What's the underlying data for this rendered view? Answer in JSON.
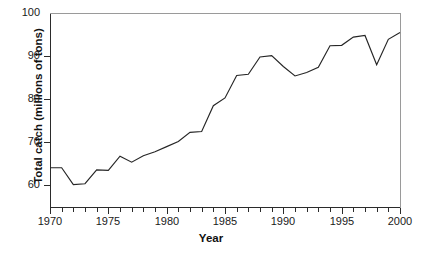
{
  "chart_data": {
    "type": "line",
    "title": "",
    "xlabel": "Year",
    "ylabel": "Total catch (millions of tons)",
    "xlim": [
      1970,
      2000
    ],
    "ylim": [
      55,
      100
    ],
    "grid": false,
    "legend": "none",
    "line_color": "#262626",
    "axis_color": "#2b2b2b",
    "x_tick_labels": [
      "1970",
      "1975",
      "1980",
      "1985",
      "1990",
      "1995",
      "2000"
    ],
    "x_tick_values": [
      1970,
      1975,
      1980,
      1985,
      1990,
      1995,
      2000
    ],
    "x_minor_tick_values": [
      1971,
      1972,
      1973,
      1974,
      1976,
      1977,
      1978,
      1979,
      1981,
      1982,
      1983,
      1984,
      1986,
      1987,
      1988,
      1989,
      1991,
      1992,
      1993,
      1994,
      1996,
      1997,
      1998,
      1999
    ],
    "y_tick_labels": [
      "60",
      "70",
      "80",
      "90",
      "100"
    ],
    "y_tick_values": [
      60,
      70,
      80,
      90,
      100
    ],
    "y_axis_visible_top": 100,
    "x": [
      1970,
      1971,
      1972,
      1973,
      1974,
      1975,
      1976,
      1977,
      1978,
      1979,
      1980,
      1981,
      1982,
      1983,
      1984,
      1985,
      1986,
      1987,
      1988,
      1989,
      1990,
      1991,
      1992,
      1993,
      1994,
      1995,
      1996,
      1997,
      1998,
      1999,
      2000
    ],
    "values": [
      64.1,
      64.1,
      60.2,
      60.4,
      63.6,
      63.5,
      66.8,
      65.4,
      66.9,
      67.8,
      69.0,
      70.2,
      72.3,
      72.5,
      78.5,
      80.3,
      85.5,
      85.8,
      89.8,
      90.1,
      87.6,
      85.4,
      86.2,
      87.4,
      92.4,
      92.5,
      94.4,
      94.8,
      88.0,
      93.9,
      95.5
    ],
    "series_name": "Total catch"
  },
  "meta": {
    "series_label": "total-catch-line"
  }
}
